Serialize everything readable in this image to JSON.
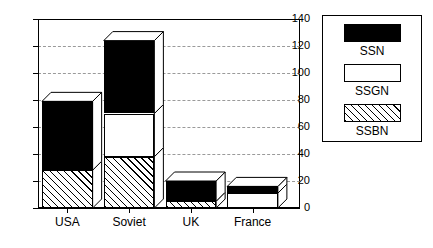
{
  "chart_data": {
    "type": "bar",
    "subtype": "stacked-3d-column",
    "title": "",
    "xlabel": "",
    "ylabel": "",
    "categories": [
      "USA",
      "Soviet",
      "UK",
      "France"
    ],
    "series": [
      {
        "name": "SSBN",
        "values": [
          28,
          38,
          5,
          0
        ],
        "color": "#ffffff",
        "fill": "diagonal-hatch"
      },
      {
        "name": "SSGN",
        "values": [
          0,
          32,
          0,
          11
        ],
        "color": "#ffffff",
        "fill": "solid"
      },
      {
        "name": "SSN",
        "values": [
          51,
          54,
          15,
          5
        ],
        "color": "#000000",
        "fill": "solid"
      }
    ],
    "stack_order": [
      "SSBN",
      "SSGN",
      "SSN"
    ],
    "totals": [
      79,
      124,
      20,
      16
    ],
    "ylim": [
      0,
      140
    ],
    "yticks": [
      0,
      20,
      40,
      60,
      80,
      100,
      120,
      140
    ],
    "ytick_labels": [
      "0",
      "20",
      "40",
      "60",
      "80",
      "100",
      "120",
      "140"
    ],
    "grid": true,
    "grid_style": "dashed",
    "legend_position": "right-outside"
  },
  "legend": {
    "items": [
      {
        "label": "SSN",
        "swatch": "black-swatch"
      },
      {
        "label": "SSGN",
        "swatch": "white-swatch"
      },
      {
        "label": "SSBN",
        "swatch": "hatched-swatch"
      }
    ]
  },
  "axis": {
    "y_ticks": [
      "140",
      "120",
      "100",
      "80",
      "60",
      "40",
      "20",
      "0"
    ],
    "x_labels": [
      "USA",
      "Soviet",
      "UK",
      "France"
    ]
  }
}
